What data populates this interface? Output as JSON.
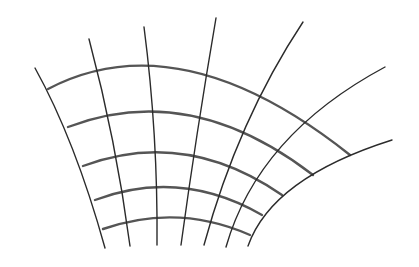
{
  "diagram": {
    "width": 419,
    "height": 267,
    "background": "#ffffff",
    "radial_color": "#2b2b2b",
    "arc_color": "#555555",
    "radial_lines": [
      {
        "id": "r1",
        "d": "M35,68 Q75,140 105,248"
      },
      {
        "id": "r2",
        "d": "M89,39 Q116,140 130,246"
      },
      {
        "id": "r3",
        "d": "M144,27 Q158,135 157,245"
      },
      {
        "id": "r4",
        "d": "M216,18 Q196,135 181,245"
      },
      {
        "id": "r5",
        "d": "M303,22 Q238,120 204,245"
      },
      {
        "id": "r6",
        "d": "M385,67 Q258,135 226,247"
      },
      {
        "id": "r7",
        "d": "M392,140 Q272,178 248,246"
      }
    ],
    "arc_lines": [
      {
        "id": "a1",
        "d": "M48,89 Q180,20 350,155"
      },
      {
        "id": "a2",
        "d": "M68,127 Q190,80 313,175"
      },
      {
        "id": "a3",
        "d": "M83,166 Q185,128 282,195"
      },
      {
        "id": "a4",
        "d": "M95,200 Q180,168 262,215"
      },
      {
        "id": "a5",
        "d": "M103,229 Q178,203 250,235"
      }
    ]
  }
}
